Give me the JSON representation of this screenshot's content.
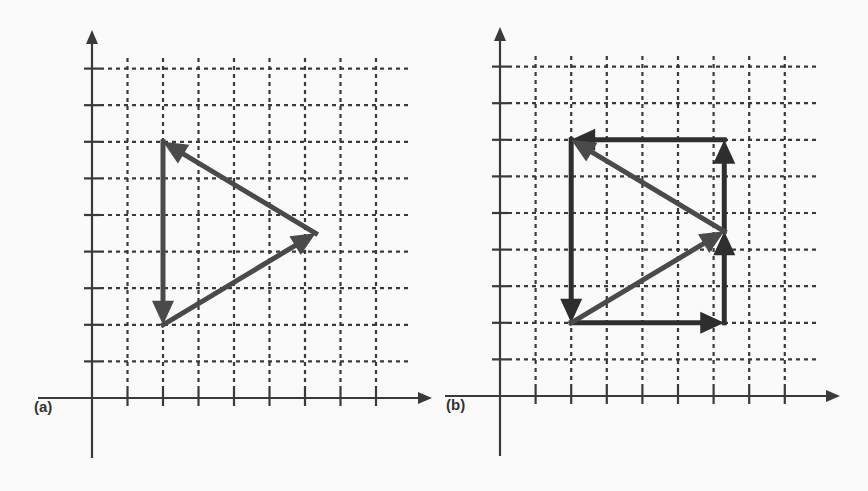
{
  "figure": {
    "colors": {
      "background": "#fafafa",
      "axis": "#3a3a3a",
      "grid": "#3a3a3a",
      "vector_dark": "#2e2e2e",
      "vector_mid": "#4a4a4a"
    },
    "panels": [
      {
        "id": "a",
        "label": "(a)",
        "label_pos": [
          34,
          398
        ],
        "origin_px": [
          92,
          398
        ],
        "unit_px": [
          35.5,
          36.6
        ],
        "x_ticks": 8,
        "y_ticks": 9,
        "x_axis_extent_px": [
          38,
          432
        ],
        "y_axis_extent_px": [
          458,
          30
        ],
        "grid_cols": 8,
        "grid_rows": 9,
        "vectors": [
          {
            "name": "vertical-down",
            "from": [
              2,
              7
            ],
            "to": [
              2,
              2
            ],
            "shade": "vector_mid"
          },
          {
            "name": "diagonal-up-right",
            "from": [
              2,
              2
            ],
            "to": [
              6.3,
              4.5
            ],
            "shade": "vector_mid"
          },
          {
            "name": "diagonal-up-left",
            "from": [
              6.3,
              4.5
            ],
            "to": [
              2,
              7
            ],
            "shade": "vector_mid"
          }
        ]
      },
      {
        "id": "b",
        "label": "(b)",
        "label_pos": [
          446,
          396
        ],
        "origin_px": [
          500,
          396
        ],
        "unit_px": [
          35.6,
          36.6
        ],
        "x_ticks": 8,
        "y_ticks": 9,
        "x_axis_extent_px": [
          445,
          840
        ],
        "y_axis_extent_px": [
          456,
          27
        ],
        "grid_cols": 8,
        "grid_rows": 9,
        "vectors": [
          {
            "name": "left-down",
            "from": [
              2,
              7
            ],
            "to": [
              2,
              2
            ],
            "shade": "vector_dark"
          },
          {
            "name": "bottom-right",
            "from": [
              2,
              2
            ],
            "to": [
              6.3,
              2
            ],
            "shade": "vector_dark"
          },
          {
            "name": "right-up-lower",
            "from": [
              6.3,
              2
            ],
            "to": [
              6.3,
              4.5
            ],
            "shade": "vector_dark"
          },
          {
            "name": "right-up-upper",
            "from": [
              6.3,
              4.5
            ],
            "to": [
              6.3,
              7
            ],
            "shade": "vector_dark"
          },
          {
            "name": "top-left",
            "from": [
              6.3,
              7
            ],
            "to": [
              2,
              7
            ],
            "shade": "vector_dark"
          },
          {
            "name": "diagonal-up-right",
            "from": [
              2,
              2
            ],
            "to": [
              6.3,
              4.5
            ],
            "shade": "vector_mid"
          },
          {
            "name": "diagonal-up-left",
            "from": [
              6.3,
              4.5
            ],
            "to": [
              2,
              7
            ],
            "shade": "vector_mid"
          }
        ]
      }
    ]
  }
}
